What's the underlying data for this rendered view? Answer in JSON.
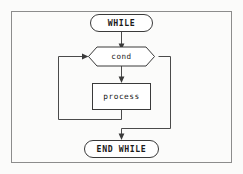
{
  "diagram": {
    "type": "flowchart",
    "background_color": "#fbfbfa",
    "line_color": "#4a4a4a",
    "shape_fill": "#ffffff",
    "frame_color": "#8c8c8c",
    "nodes": [
      {
        "id": "start",
        "label": "WHILE",
        "shape": "stadium",
        "role": "loop-start-terminal"
      },
      {
        "id": "condition",
        "label": "cond",
        "shape": "hexagon",
        "role": "decision"
      },
      {
        "id": "body",
        "label": "process",
        "shape": "rectangle",
        "role": "process"
      },
      {
        "id": "end",
        "label": "END WHILE",
        "shape": "stadium",
        "role": "loop-end-terminal"
      }
    ],
    "edges": [
      {
        "id": "e1",
        "from": "start",
        "to": "condition",
        "label": "",
        "style": "straight-down"
      },
      {
        "id": "e2",
        "from": "condition",
        "to": "body",
        "label": "",
        "style": "straight-down"
      },
      {
        "id": "e3",
        "from": "body",
        "to": "condition",
        "label": "",
        "style": "loop-back-left"
      },
      {
        "id": "e4",
        "from": "condition",
        "to": "end",
        "label": "",
        "style": "exit-right"
      }
    ]
  }
}
